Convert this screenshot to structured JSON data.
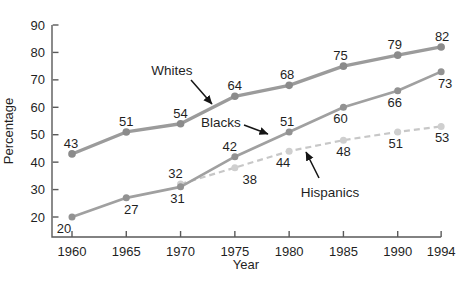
{
  "chart_data": {
    "type": "line",
    "title": "",
    "xlabel": "Year",
    "ylabel": "Percentage",
    "x_ticks": [
      1960,
      1965,
      1970,
      1975,
      1980,
      1985,
      1990,
      1994
    ],
    "y_ticks": [
      20,
      30,
      40,
      50,
      60,
      70,
      80,
      90
    ],
    "xlim": [
      1958,
      1994.5
    ],
    "ylim": [
      12,
      90
    ],
    "grid": false,
    "legend": "inline-annotations",
    "axis_color": "#5a5a5a",
    "text_color": "#1f1f1f",
    "arrow_color": "#151515",
    "series": [
      {
        "name": "Whites",
        "line_color": "#9b9b9b",
        "marker_color": "#8b8b8b",
        "line_style": "solid",
        "line_width": 3.3,
        "marker_size": 3.8,
        "x": [
          1960,
          1965,
          1970,
          1975,
          1980,
          1985,
          1990,
          1994
        ],
        "values": [
          43,
          51,
          54,
          64,
          68,
          75,
          79,
          82
        ],
        "label_sides": [
          "above",
          "above",
          "above",
          "above",
          "above",
          "above",
          "above",
          "above"
        ],
        "label_dx": [
          -1,
          0,
          0,
          0,
          -2,
          -3,
          -3,
          1
        ]
      },
      {
        "name": "Blacks",
        "line_color": "#a0a0a0",
        "marker_color": "#929292",
        "line_style": "solid",
        "line_width": 2.7,
        "marker_size": 3.5,
        "x": [
          1960,
          1965,
          1970,
          1975,
          1980,
          1985,
          1990,
          1994
        ],
        "values": [
          20,
          27,
          31,
          42,
          51,
          60,
          66,
          73
        ],
        "label_sides": [
          "below",
          "below",
          "below",
          "above",
          "above",
          "below",
          "below",
          "below"
        ],
        "label_dx": [
          -8,
          5,
          -3,
          -5,
          -2,
          -3,
          -3,
          4
        ]
      },
      {
        "name": "Hispanics",
        "line_color": "#c7c7c7",
        "marker_color": "#cfcfcf",
        "line_style": "dashed",
        "line_width": 2.2,
        "marker_size": 3.5,
        "x": [
          1970,
          1975,
          1980,
          1985,
          1990,
          1994
        ],
        "values": [
          32,
          38,
          44,
          48,
          51,
          53
        ],
        "label_sides": [
          "above",
          "below",
          "below",
          "below",
          "below",
          "below"
        ],
        "label_dx": [
          -5,
          15,
          -6,
          0,
          -2,
          1
        ]
      }
    ],
    "annotations": [
      {
        "text": "Whites",
        "text_x": 172,
        "text_y": 75,
        "arrow_from": [
          191,
          80
        ],
        "arrow_to": [
          212,
          104
        ]
      },
      {
        "text": "Blacks",
        "text_x": 221,
        "text_y": 127,
        "arrow_from": [
          244,
          125
        ],
        "arrow_to": [
          268,
          134
        ]
      },
      {
        "text": "Hispanics",
        "text_x": 330,
        "text_y": 197,
        "arrow_from": [
          319,
          178
        ],
        "arrow_to": [
          306,
          152
        ]
      }
    ]
  }
}
